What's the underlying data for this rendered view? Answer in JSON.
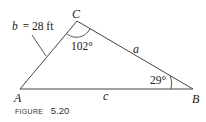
{
  "figure": {
    "caption_prefix": "FIGURE",
    "caption_number": "5.20"
  },
  "vertices": {
    "A": {
      "label": "A",
      "x": 20,
      "y": 89
    },
    "B": {
      "label": "B",
      "x": 193,
      "y": 89
    },
    "C": {
      "label": "C",
      "x": 77,
      "y": 21
    }
  },
  "sides": {
    "a": {
      "label": "a"
    },
    "b": {
      "label": "b = 28 ft",
      "var": "b",
      "value": "= 28 ft"
    },
    "c": {
      "label": "c"
    }
  },
  "angles": {
    "C": {
      "label": "102°"
    },
    "B": {
      "label": "29°"
    }
  },
  "colors": {
    "stroke": "#444444",
    "text": "#222222",
    "background": "#ffffff"
  }
}
